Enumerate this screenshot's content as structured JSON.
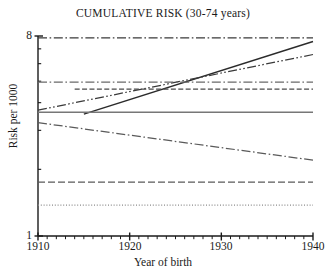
{
  "chart_data": {
    "type": "line",
    "title": "CUMULATIVE RISK (30-74 years)",
    "xlabel": "Year of birth",
    "ylabel": "Risk per 1000",
    "xlim": [
      1910,
      1940
    ],
    "ylim": [
      1,
      8
    ],
    "yscale": "log",
    "grid": false,
    "legend": "none",
    "xticks": [
      1910,
      1920,
      1930,
      1940
    ],
    "xtick_labels": [
      "1910",
      "1920",
      "1930",
      "1940"
    ],
    "xminor_step": 1,
    "yticks": [
      1,
      2,
      3,
      4,
      5,
      6,
      7,
      8
    ],
    "ytick_labels": [
      "1",
      "",
      "",
      "",
      "",
      "",
      "",
      "8"
    ],
    "series": [
      {
        "name": "series-1-top-flat",
        "style": "dash-dot",
        "color": "#3a3a3a",
        "x": [
          1910,
          1940
        ],
        "values": [
          7.85,
          7.85
        ]
      },
      {
        "name": "series-2-steep-rising-solid",
        "style": "solid",
        "color": "#2b2b2b",
        "x": [
          1915,
          1940
        ],
        "values": [
          3.55,
          7.55
        ]
      },
      {
        "name": "series-3-rising-dash-dot-dot",
        "style": "dash-dot-dot",
        "color": "#3a3a3a",
        "x": [
          1910,
          1940
        ],
        "values": [
          3.7,
          6.6
        ]
      },
      {
        "name": "series-4-flat-dash-dot",
        "style": "dash-dot",
        "color": "#6a6a6a",
        "x": [
          1910,
          1940
        ],
        "values": [
          4.95,
          4.95
        ]
      },
      {
        "name": "series-5-flat-dashed",
        "style": "dashed",
        "color": "#4a4a4a",
        "x": [
          1914,
          1940
        ],
        "values": [
          4.6,
          4.6
        ]
      },
      {
        "name": "series-6-flat-solid",
        "style": "solid",
        "color": "#777777",
        "x": [
          1910,
          1940
        ],
        "values": [
          3.62,
          3.62
        ]
      },
      {
        "name": "series-7-declining-dash-dot",
        "style": "dash-dot",
        "color": "#5a5a5a",
        "x": [
          1910,
          1940
        ],
        "values": [
          3.25,
          2.2
        ]
      },
      {
        "name": "series-8-low-flat-dashed",
        "style": "long-dash",
        "color": "#5a5a5a",
        "x": [
          1910,
          1940
        ],
        "values": [
          1.75,
          1.75
        ]
      },
      {
        "name": "series-9-lowest-dotted",
        "style": "dotted",
        "color": "#8a8a8a",
        "x": [
          1910,
          1940
        ],
        "values": [
          1.38,
          1.38
        ]
      }
    ]
  },
  "axis": {
    "y_label": "Risk per 1000",
    "x_label": "Year of birth",
    "y_top_label": "8",
    "y_bottom_label": "1"
  },
  "colors": {
    "axis": "#1a1a1a",
    "background": "#ffffff"
  }
}
